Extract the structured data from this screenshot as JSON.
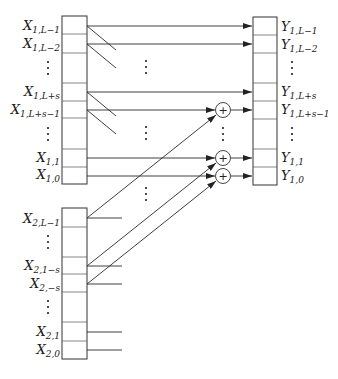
{
  "diagram": {
    "type": "data-flow block diagram",
    "x1_register": {
      "labels": [
        {
          "base": "X",
          "sub": "1,L−1"
        },
        {
          "base": "X",
          "sub": "1,L−2"
        },
        {
          "base": "⋮",
          "sub": ""
        },
        {
          "base": "X",
          "sub": "1,L+s"
        },
        {
          "base": "X",
          "sub": "1,L+s−1"
        },
        {
          "base": "⋮",
          "sub": ""
        },
        {
          "base": "X",
          "sub": "1,1"
        },
        {
          "base": "X",
          "sub": "1,0"
        }
      ]
    },
    "x2_register": {
      "labels": [
        {
          "base": "X",
          "sub": "2,L−1"
        },
        {
          "base": "⋮",
          "sub": ""
        },
        {
          "base": "X",
          "sub": "2,1−s"
        },
        {
          "base": "X",
          "sub": "2,−s"
        },
        {
          "base": "⋮",
          "sub": ""
        },
        {
          "base": "X",
          "sub": "2,1"
        },
        {
          "base": "X",
          "sub": "2,0"
        }
      ]
    },
    "y1_register": {
      "labels": [
        {
          "base": "Y",
          "sub": "1,L−1"
        },
        {
          "base": "Y",
          "sub": "1,L−2"
        },
        {
          "base": "⋮",
          "sub": ""
        },
        {
          "base": "Y",
          "sub": "1,L+s"
        },
        {
          "base": "Y",
          "sub": "1,L+s−1"
        },
        {
          "base": "⋮",
          "sub": ""
        },
        {
          "base": "Y",
          "sub": "1,1"
        },
        {
          "base": "Y",
          "sub": "1,0"
        }
      ]
    },
    "adder_symbol": "+",
    "ellipsis": "⋮"
  }
}
